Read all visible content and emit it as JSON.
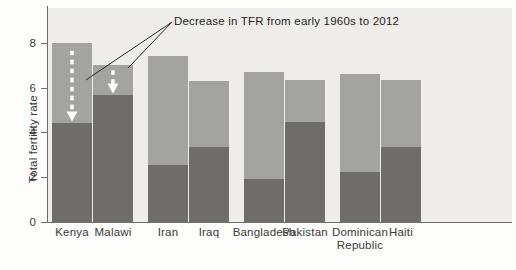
{
  "chart_data": {
    "type": "bar",
    "title": "",
    "subtitle": "",
    "xlabel": "",
    "ylabel": "Total fertility rate",
    "ylim": [
      0,
      8.8
    ],
    "yticks": [
      0,
      2,
      4,
      6,
      8
    ],
    "ytick_labels": [
      "0",
      "2",
      "4",
      "6",
      "8"
    ],
    "grid": false,
    "legend_position": "none",
    "stacked_style": "overlay-two-tone",
    "categories": [
      "Kenya",
      "Malawi",
      "Iran",
      "Iraq",
      "Bangladesh",
      "Pakistan",
      "Dominican Republic",
      "Haiti"
    ],
    "series": [
      {
        "name": "TFR early 1960s",
        "color": "#a3a39f",
        "values": [
          8.0,
          7.0,
          7.4,
          6.3,
          6.7,
          6.35,
          6.6,
          6.35
        ]
      },
      {
        "name": "TFR 2012",
        "color": "#6e6d6a",
        "values": [
          4.4,
          5.65,
          2.55,
          3.35,
          1.9,
          4.45,
          2.25,
          3.35
        ]
      }
    ],
    "annotations": [
      {
        "text": "Decrease in TFR from early 1960s to 2012",
        "pointers": [
          "Kenya",
          "Malawi"
        ],
        "arrow_style": "white-dashed-down-arrow-in-bar"
      }
    ]
  },
  "axis": {
    "y_title": "Total fertility rate",
    "ticks": [
      {
        "label": "8",
        "value": 8
      },
      {
        "label": "6",
        "value": 6
      },
      {
        "label": "4",
        "value": 4
      },
      {
        "label": "2",
        "value": 2
      },
      {
        "label": "0",
        "value": 0
      }
    ]
  },
  "labels": {
    "x_categories": [
      {
        "line1": "Kenya",
        "line2": ""
      },
      {
        "line1": "Malawi",
        "line2": ""
      },
      {
        "line1": "Iran",
        "line2": ""
      },
      {
        "line1": "Iraq",
        "line2": ""
      },
      {
        "line1": "Bangladesh",
        "line2": ""
      },
      {
        "line1": "Pakistan",
        "line2": ""
      },
      {
        "line1": "Dominican",
        "line2": "Republic"
      },
      {
        "line1": "Haiti",
        "line2": ""
      }
    ]
  },
  "annotation": {
    "text": "Decrease in TFR from early 1960s to 2012"
  },
  "colors": {
    "bar_light": "#a3a39f",
    "bar_dark": "#6e6d6a",
    "plot_background": "#eeedea",
    "page_background": "#fdfdfb",
    "axis": "#6d6c68",
    "text": "#3b3a38",
    "arrow_white": "#ffffff",
    "annotation_line": "#2b2a28"
  }
}
